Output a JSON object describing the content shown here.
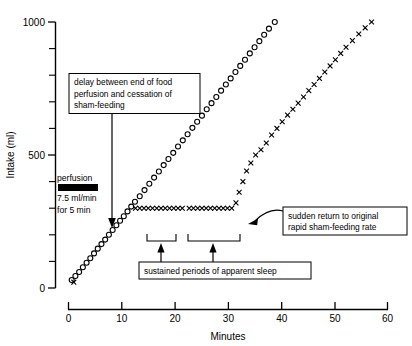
{
  "chart_data": {
    "type": "scatter",
    "title": "",
    "xlabel": "Minutes",
    "ylabel": "Intake (ml)",
    "xlim": [
      0,
      60
    ],
    "ylim": [
      0,
      1000
    ],
    "xticks": [
      0,
      10,
      20,
      30,
      40,
      50,
      60
    ],
    "xticklabels": [
      "0",
      "10",
      "20",
      "30",
      "40",
      "50",
      "60"
    ],
    "yticks": [
      0,
      100,
      200,
      300,
      400,
      500,
      600,
      700,
      800,
      900,
      1000
    ],
    "yticklabels": [
      "0",
      "",
      "",
      "",
      "",
      "500",
      "",
      "",
      "",
      "",
      "1000"
    ],
    "grid": false,
    "legend": "none",
    "series": [
      {
        "name": "continuous sham-feeding",
        "marker": "circle",
        "points": [
          [
            0.6,
            30
          ],
          [
            1.3,
            45
          ],
          [
            2.0,
            60
          ],
          [
            2.7,
            78
          ],
          [
            3.4,
            95
          ],
          [
            4.1,
            112
          ],
          [
            4.8,
            130
          ],
          [
            5.5,
            148
          ],
          [
            6.2,
            165
          ],
          [
            6.9,
            182
          ],
          [
            7.6,
            200
          ],
          [
            8.3,
            218
          ],
          [
            9.0,
            236
          ],
          [
            9.7,
            253
          ],
          [
            10.4,
            270
          ],
          [
            11.1,
            288
          ],
          [
            11.8,
            306
          ],
          [
            12.5,
            324
          ],
          [
            13.4,
            345
          ],
          [
            14.3,
            368
          ],
          [
            15.2,
            392
          ],
          [
            16.1,
            415
          ],
          [
            17.0,
            438
          ],
          [
            17.9,
            462
          ],
          [
            18.8,
            485
          ],
          [
            19.7,
            508
          ],
          [
            20.6,
            532
          ],
          [
            21.5,
            555
          ],
          [
            22.4,
            578
          ],
          [
            23.3,
            602
          ],
          [
            24.2,
            625
          ],
          [
            25.1,
            648
          ],
          [
            26.0,
            672
          ],
          [
            26.9,
            695
          ],
          [
            27.8,
            718
          ],
          [
            28.7,
            742
          ],
          [
            29.6,
            765
          ],
          [
            30.5,
            788
          ],
          [
            31.4,
            812
          ],
          [
            32.3,
            835
          ],
          [
            33.2,
            858
          ],
          [
            34.1,
            882
          ],
          [
            35.0,
            905
          ],
          [
            35.9,
            928
          ],
          [
            36.8,
            952
          ],
          [
            37.7,
            975
          ],
          [
            38.8,
            1000
          ]
        ]
      },
      {
        "name": "sham-feeding with intragastric food perfusion",
        "marker": "x",
        "points": [
          [
            1.0,
            22
          ],
          [
            12.6,
            300
          ],
          [
            13.4,
            300
          ],
          [
            14.2,
            300
          ],
          [
            15.0,
            300
          ],
          [
            15.8,
            300
          ],
          [
            16.6,
            300
          ],
          [
            17.4,
            300
          ],
          [
            18.2,
            300
          ],
          [
            19.0,
            300
          ],
          [
            19.8,
            300
          ],
          [
            20.6,
            300
          ],
          [
            21.4,
            300
          ],
          [
            22.7,
            300
          ],
          [
            23.5,
            300
          ],
          [
            24.3,
            300
          ],
          [
            25.1,
            300
          ],
          [
            25.9,
            300
          ],
          [
            26.7,
            300
          ],
          [
            27.5,
            300
          ],
          [
            28.3,
            300
          ],
          [
            29.1,
            300
          ],
          [
            29.9,
            300
          ],
          [
            30.7,
            300
          ],
          [
            31.5,
            320
          ],
          [
            32.1,
            360
          ],
          [
            32.8,
            400
          ],
          [
            33.5,
            440
          ],
          [
            34.3,
            470
          ],
          [
            35.2,
            500
          ],
          [
            36.2,
            520
          ],
          [
            37.2,
            545
          ],
          [
            38.2,
            575
          ],
          [
            39.2,
            600
          ],
          [
            40.2,
            625
          ],
          [
            41.2,
            650
          ],
          [
            42.2,
            672
          ],
          [
            43.2,
            695
          ],
          [
            44.2,
            718
          ],
          [
            45.2,
            742
          ],
          [
            46.2,
            765
          ],
          [
            47.2,
            788
          ],
          [
            48.2,
            812
          ],
          [
            49.2,
            835
          ],
          [
            50.2,
            858
          ],
          [
            51.2,
            882
          ],
          [
            52.2,
            905
          ],
          [
            53.4,
            930
          ],
          [
            54.6,
            955
          ],
          [
            55.8,
            978
          ],
          [
            57.0,
            1000
          ]
        ]
      }
    ],
    "annotations": [
      {
        "id": "delay-note",
        "lines": [
          "delay between end of food",
          "perfusion and cessation of",
          "sham-feeding"
        ]
      },
      {
        "id": "sudden-return-note",
        "lines": [
          "sudden return to original",
          "rapid sham-feeding rate"
        ]
      },
      {
        "id": "sleep-note",
        "lines": [
          "sustained periods of apparent sleep"
        ]
      }
    ],
    "perfusion_legend": {
      "title": "perfusion",
      "rate": "7.5 ml/min",
      "duration": "for 5 min",
      "bar_color": "#000000"
    }
  }
}
